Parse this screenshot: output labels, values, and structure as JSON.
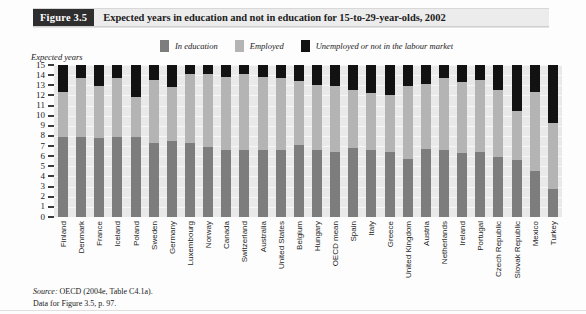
{
  "header": {
    "figure_tag": "Figure 3.5",
    "title": "Expected years in education and not in education for 15-to-29-year-olds, 2002"
  },
  "legend": {
    "items": [
      {
        "label": "In education",
        "color": "#7d7d7d",
        "key": "in_education"
      },
      {
        "label": "Employed",
        "color": "#b4b4b4",
        "key": "employed"
      },
      {
        "label": "Unemployed or not in the labour market",
        "color": "#121212",
        "key": "unemployed"
      }
    ]
  },
  "axis": {
    "y_title": "Expected years",
    "y_ticks": [
      "15",
      "14",
      "13",
      "12",
      "11",
      "10",
      "9",
      "8",
      "7",
      "6",
      "5",
      "4",
      "3",
      "2",
      "1",
      "0"
    ]
  },
  "source": {
    "label": "Source:",
    "text": "OECD (2004e, Table C4.1a).",
    "line2": "Data for Figure 3.5, p. 97."
  },
  "chart_data": {
    "type": "bar",
    "stacked": true,
    "title": "Expected years in education and not in education for 15-to-29-year-olds, 2002",
    "xlabel": "",
    "ylabel": "Expected years",
    "ylim": [
      0,
      15
    ],
    "grid": true,
    "legend_position": "top-center",
    "categories": [
      "Finland",
      "Denmark",
      "France",
      "Iceland",
      "Poland",
      "Sweden",
      "Germany",
      "Luxembourg",
      "Norway",
      "Canada",
      "Switzerland",
      "Australia",
      "United States",
      "Belgium",
      "Hungary",
      "OECD mean",
      "Spain",
      "Italy",
      "Greece",
      "United Kingdom",
      "Austria",
      "Netherlands",
      "Ireland",
      "Portugal",
      "Czech Republic",
      "Slovak Republic",
      "Mexico",
      "Turkey"
    ],
    "series": [
      {
        "name": "In education",
        "color": "#7d7d7d",
        "values": [
          7.9,
          7.9,
          7.8,
          7.9,
          7.9,
          7.3,
          7.5,
          7.3,
          6.9,
          6.6,
          6.6,
          6.6,
          6.6,
          7.1,
          6.6,
          6.4,
          6.8,
          6.6,
          6.4,
          5.7,
          6.7,
          6.6,
          6.3,
          6.4,
          5.9,
          5.6,
          4.5,
          2.8
        ]
      },
      {
        "name": "Employed",
        "color": "#b4b4b4",
        "values": [
          4.4,
          5.8,
          5.1,
          5.8,
          3.9,
          6.2,
          5.3,
          6.8,
          7.2,
          7.2,
          7.5,
          7.2,
          7.1,
          6.3,
          6.4,
          6.5,
          5.7,
          5.6,
          5.6,
          7.2,
          6.4,
          7.1,
          7.0,
          7.1,
          6.6,
          4.9,
          7.8,
          6.5
        ]
      },
      {
        "name": "Unemployed or not in the labour market",
        "color": "#121212",
        "values": [
          2.7,
          1.3,
          2.1,
          1.3,
          3.2,
          1.5,
          2.2,
          0.9,
          0.9,
          1.2,
          0.9,
          1.2,
          1.3,
          1.6,
          2.0,
          2.1,
          2.5,
          2.8,
          3.0,
          2.1,
          1.9,
          1.3,
          1.7,
          1.5,
          2.5,
          4.5,
          2.7,
          5.7
        ]
      }
    ]
  }
}
